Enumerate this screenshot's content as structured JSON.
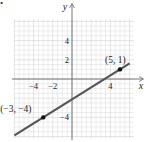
{
  "figure": {
    "bullet": "•"
  },
  "chart_data": {
    "type": "line",
    "title": "",
    "xlabel": "x",
    "ylabel": "y",
    "xlim": [
      -6,
      6
    ],
    "ylim": [
      -6,
      6
    ],
    "grid": true,
    "x_ticks": [
      {
        "value": -4,
        "label": "−4"
      },
      {
        "value": -2,
        "label": "−2"
      },
      {
        "value": 4,
        "label": "4"
      }
    ],
    "y_ticks": [
      {
        "value": 4,
        "label": "4"
      },
      {
        "value": 2,
        "label": "2"
      },
      {
        "value": -4,
        "label": "−4"
      }
    ],
    "series": [
      {
        "name": "line through (-3,-4) and (5,1)",
        "slope": 0.625,
        "intercept": -2.125,
        "x": [
          -6,
          -3,
          5,
          6
        ],
        "y": [
          -5.875,
          -4,
          1,
          1.625
        ]
      }
    ],
    "points": [
      {
        "x": -3,
        "y": -4,
        "label": "(−3, −4)"
      },
      {
        "x": 5,
        "y": 1,
        "label": "(5, 1)"
      }
    ],
    "colors": {
      "line": "#555555",
      "axis": "#666666",
      "grid": "#d9d9d9",
      "grid_major": "#c8c8c8",
      "point": "#111111"
    }
  }
}
